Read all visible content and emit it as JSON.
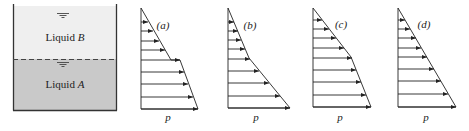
{
  "tank": {
    "upper_liquid_label": "Liquid ",
    "upper_liquid_var": "B",
    "lower_liquid_label": "Liquid ",
    "lower_liquid_var": "A",
    "colors": {
      "liquid_b": "#efefef",
      "liquid_a": "#c9c9c9",
      "wall": "#333333"
    }
  },
  "diagrams": [
    {
      "label": "(a)",
      "axis_label": "p"
    },
    {
      "label": "(b)",
      "axis_label": "p"
    },
    {
      "label": "(c)",
      "axis_label": "p"
    },
    {
      "label": "(d)",
      "axis_label": "p"
    }
  ]
}
